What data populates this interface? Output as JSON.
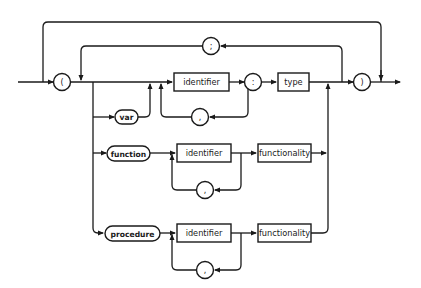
{
  "diagram": {
    "type": "syntax-diagram",
    "terminals": {
      "open_paren": "(",
      "close_paren": ")",
      "semicolon": ";",
      "colon": ":",
      "comma": ","
    },
    "keywords": {
      "var": "var",
      "function": "function",
      "procedure": "procedure"
    },
    "nonterminals": {
      "identifier": "identifier",
      "type": "type",
      "functionality": "functionality"
    },
    "rows": [
      {
        "name": "var-row",
        "items": [
          "var",
          "identifier",
          ",",
          ":",
          "type"
        ]
      },
      {
        "name": "function-row",
        "items": [
          "function",
          "identifier",
          ",",
          "functionality"
        ]
      },
      {
        "name": "procedure-row",
        "items": [
          "procedure",
          "identifier",
          ",",
          "functionality"
        ]
      }
    ],
    "colors": {
      "line": "#1a1a1a",
      "background": "#ffffff"
    }
  }
}
